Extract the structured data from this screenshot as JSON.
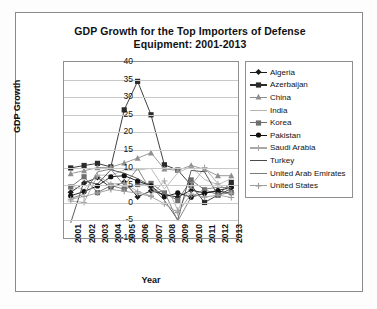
{
  "figure": {
    "title": "GDP Growth for the Top Importers of Defense Equipment: 2001-2013",
    "title_line1": "GDP Growth for the Top Importers of Defense",
    "title_line2": "Equipment: 2001-2013"
  },
  "chart_data": {
    "type": "line",
    "title": "GDP Growth for the Top Importers of Defense Equipment: 2001-2013",
    "xlabel": "Year",
    "ylabel": "GDP Growth",
    "categories": [
      "2001",
      "2002",
      "2003",
      "2004",
      "2005",
      "2006",
      "2007",
      "2008",
      "2009",
      "2010",
      "2011",
      "2012",
      "2013"
    ],
    "x": [
      2001,
      2002,
      2003,
      2004,
      2005,
      2006,
      2007,
      2008,
      2009,
      2010,
      2011,
      2012,
      2013
    ],
    "ylim": [
      -10,
      40
    ],
    "yticks": [
      -10,
      -5,
      0,
      5,
      10,
      15,
      20,
      25,
      30,
      35,
      40
    ],
    "grid": true,
    "legend_position": "right",
    "series": [
      {
        "name": "Algeria",
        "marker": "diamond",
        "color": "#1a1a1a",
        "values": [
          3.0,
          5.6,
          7.2,
          4.3,
          5.9,
          1.7,
          3.4,
          2.4,
          1.6,
          3.6,
          2.8,
          3.3,
          2.8
        ]
      },
      {
        "name": "Azerbaijan",
        "marker": "square",
        "color": "#2b2b2b",
        "values": [
          9.9,
          10.6,
          11.2,
          10.2,
          26.4,
          34.5,
          25.0,
          10.8,
          9.3,
          5.0,
          0.1,
          2.2,
          5.8
        ]
      },
      {
        "name": "China",
        "marker": "triangle",
        "color": "#8f8f8f",
        "values": [
          8.3,
          9.1,
          10.0,
          10.1,
          11.3,
          12.7,
          14.2,
          9.6,
          9.2,
          10.6,
          9.5,
          7.7,
          7.7
        ]
      },
      {
        "name": "India",
        "marker": "none",
        "color": "#b5b5b5",
        "values": [
          4.8,
          3.8,
          7.9,
          7.8,
          9.3,
          9.3,
          9.8,
          3.9,
          8.5,
          10.3,
          6.6,
          5.1,
          6.9
        ]
      },
      {
        "name": "Korea",
        "marker": "square",
        "color": "#6e6e6e",
        "values": [
          4.5,
          7.4,
          2.9,
          4.9,
          3.9,
          5.2,
          5.5,
          2.8,
          0.7,
          6.5,
          3.7,
          2.3,
          2.9
        ]
      },
      {
        "name": "Pakistan",
        "marker": "circle",
        "color": "#111111",
        "values": [
          2.0,
          3.2,
          4.8,
          7.4,
          7.7,
          6.2,
          4.8,
          1.7,
          2.8,
          1.6,
          2.7,
          3.5,
          4.4
        ]
      },
      {
        "name": "Saudi Arabia",
        "marker": "plus",
        "color": "#a8a8a8",
        "values": [
          0.5,
          0.1,
          7.7,
          5.3,
          5.6,
          3.2,
          2.0,
          6.2,
          -2.1,
          4.8,
          10.0,
          5.4,
          2.7
        ]
      },
      {
        "name": "Turkey",
        "marker": "none",
        "color": "#4a4a4a",
        "values": [
          -5.7,
          6.2,
          5.3,
          9.4,
          8.4,
          6.9,
          4.7,
          0.7,
          -4.8,
          9.2,
          8.8,
          2.1,
          4.1
        ]
      },
      {
        "name": "United Arab Emirates",
        "marker": "none",
        "color": "#7a7a7a",
        "values": [
          1.3,
          2.4,
          8.8,
          9.6,
          4.9,
          9.8,
          3.2,
          3.2,
          -5.2,
          1.6,
          3.9,
          4.4,
          4.3
        ]
      },
      {
        "name": "United States",
        "marker": "plus",
        "color": "#9d9d9d",
        "values": [
          1.0,
          1.8,
          2.8,
          3.8,
          3.3,
          2.7,
          1.8,
          -0.3,
          -2.8,
          2.5,
          1.6,
          2.2,
          1.5
        ]
      }
    ]
  },
  "legend": {
    "items": [
      {
        "label": "Algeria"
      },
      {
        "label": "Azerbaijan"
      },
      {
        "label": "China"
      },
      {
        "label": "India"
      },
      {
        "label": "Korea"
      },
      {
        "label": "Pakistan"
      },
      {
        "label": "Saudi Arabia"
      },
      {
        "label": "Turkey"
      },
      {
        "label": "United Arab Emirates"
      },
      {
        "label": "United States"
      }
    ]
  }
}
